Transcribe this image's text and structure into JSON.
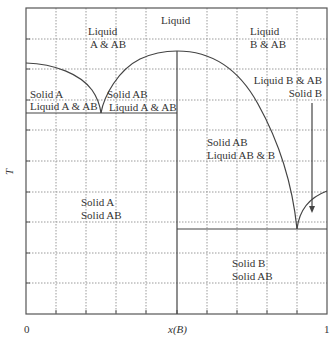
{
  "diagram": {
    "type": "phase-diagram",
    "axes": {
      "x_label": "x(B)",
      "y_label": "T",
      "x_tick_left": "0",
      "x_tick_right": "1"
    },
    "regions": {
      "liquid": "Liquid",
      "liquid_a_ab_line1": "Liquid",
      "liquid_a_ab_line2": "A & AB",
      "liquid_b_ab_line1": "Liquid",
      "liquid_b_ab_line2": "B & AB",
      "solid_a_liquid_line1": "Solid A",
      "solid_a_liquid_line2": "Liquid A & AB",
      "solid_ab_liquid_line1": "Solid AB",
      "solid_ab_liquid_line2": "Liquid A & AB",
      "liquid_b_solid_line1": "Liquid B & AB",
      "liquid_b_solid_line2": "Solid B",
      "solid_ab_liquid_ab_b_line1": "Solid AB",
      "solid_ab_liquid_ab_b_line2": "Liquid AB & B",
      "solid_a_solid_ab_line1": "Solid A",
      "solid_a_solid_ab_line2": "Solid AB",
      "solid_b_solid_ab_line1": "Solid B",
      "solid_b_solid_ab_line2": "Solid AB"
    },
    "colors": {
      "curve": "#444444",
      "grid": "#999999",
      "frame": "#555555",
      "text": "#333333"
    }
  }
}
